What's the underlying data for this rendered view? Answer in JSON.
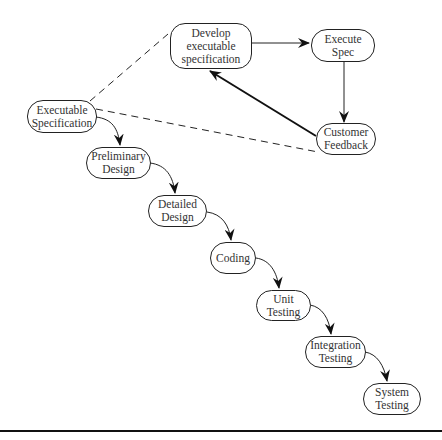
{
  "diagram": {
    "type": "process-flow",
    "nodes": {
      "develop": {
        "lines": [
          "Develop",
          "executable",
          "specification"
        ]
      },
      "execute_spec": {
        "lines": [
          "Execute",
          "Spec"
        ]
      },
      "customer_feedback": {
        "lines": [
          "Customer",
          "Feedback"
        ]
      },
      "exec_specification": {
        "lines": [
          "Executable",
          "Specification"
        ]
      },
      "preliminary_design": {
        "lines": [
          "Preliminary",
          "Design"
        ]
      },
      "detailed_design": {
        "lines": [
          "Detailed",
          "Design"
        ]
      },
      "coding": {
        "lines": [
          "Coding"
        ]
      },
      "unit_testing": {
        "lines": [
          "Unit",
          "Testing"
        ]
      },
      "integration_testing": {
        "lines": [
          "Integration",
          "Testing"
        ]
      },
      "system_testing": {
        "lines": [
          "System",
          "Testing"
        ]
      }
    },
    "edges": [
      {
        "from": "develop",
        "to": "execute_spec",
        "style": "solid"
      },
      {
        "from": "execute_spec",
        "to": "customer_feedback",
        "style": "solid"
      },
      {
        "from": "customer_feedback",
        "to": "develop",
        "style": "solid-bold"
      },
      {
        "from": "exec_specification",
        "to": "develop",
        "style": "dashed"
      },
      {
        "from": "exec_specification",
        "to": "customer_feedback",
        "style": "dashed"
      },
      {
        "from": "exec_specification",
        "to": "preliminary_design",
        "style": "curved"
      },
      {
        "from": "preliminary_design",
        "to": "detailed_design",
        "style": "curved"
      },
      {
        "from": "detailed_design",
        "to": "coding",
        "style": "curved"
      },
      {
        "from": "coding",
        "to": "unit_testing",
        "style": "curved"
      },
      {
        "from": "unit_testing",
        "to": "integration_testing",
        "style": "curved"
      },
      {
        "from": "integration_testing",
        "to": "system_testing",
        "style": "curved"
      }
    ],
    "colors": {
      "stroke": "#222222",
      "text": "#333333",
      "background": "#ffffff"
    }
  }
}
